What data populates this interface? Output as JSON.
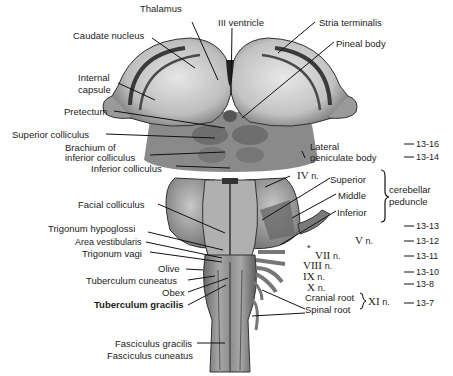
{
  "figure": {
    "labels": {
      "thalamus": "Thalamus",
      "third_ventricle": "III ventricle",
      "stria_terminalis": "Stria terminalis",
      "caudate_nucleus": "Caudate nucleus",
      "pineal_body": "Pineal body",
      "internal_capsule_1": "Internal",
      "internal_capsule_2": "capsule",
      "pretectum": "Pretectum",
      "superior_colliculus": "Superior colliculus",
      "brachium_1": "Brachium of",
      "brachium_2": "inferior colliculus",
      "lateral_geniculate_1": "Lateral",
      "lateral_geniculate_2": "geniculate body",
      "inferior_colliculus": "Inferior colliculus",
      "iv_n": "IV",
      "iv_n_suffix": "n.",
      "superior": "Superior",
      "middle": "Middle",
      "inferior": "Inferior",
      "cerebellar_peduncle_1": "cerebellar",
      "cerebellar_peduncle_2": "peduncle",
      "facial_colliculus": "Facial colliculus",
      "trigonum_hypoglossi": "Trigonum hypoglossi",
      "area_vestibularis": "Area vestibularis",
      "trigonum_vagi": "Trigonum vagi",
      "olive": "Olive",
      "tuberculum_cuneatus": "Tuberculum cuneatus",
      "obex": "Obex",
      "tuberculum_gracilis": "Tuberculum gracilis",
      "fasciculus_gracilis": "Fasciculus gracilis",
      "fasciculus_cuneatus": "Fasciculus cuneatus",
      "v_n": "V",
      "vii_n": "VII",
      "viii_n": "VIII",
      "ix_n": "IX",
      "x_n": "X",
      "xi_n": "XI",
      "n_suffix": "n.",
      "cranial_root": "Cranial root",
      "spinal_root": "Spinal root",
      "asterisk": "*"
    },
    "refs": {
      "r1": "13-16",
      "r2": "13-14",
      "r3": "13-13",
      "r4": "13-12",
      "r5": "13-11",
      "r6": "13-10",
      "r7": "13-8",
      "r8": "13-7"
    }
  }
}
